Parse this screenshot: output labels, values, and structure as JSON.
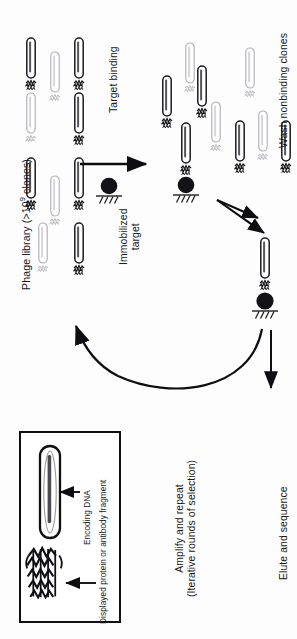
{
  "figure": {
    "orientation": "rotated-90-ccw",
    "background_color": "#fdfdfd",
    "ink_color": "#16161a",
    "faded_ink_color": "#b9b9bd"
  },
  "labels": {
    "phage_library_prefix": "Phage library (>10",
    "phage_library_exponent": "9",
    "phage_library_suffix": " clones)",
    "target_binding": "Target binding",
    "immobilized_line1": "Immobilized",
    "immobilized_line2": "target",
    "wash_nonbinding": "Wash nonbinding clones",
    "elute_and_sequence": "Elute and sequence",
    "amplify_line1": "Amplify and repeat",
    "amplify_line2": "(Iterative rounds of selection)",
    "encoding_dna": "Encoding DNA",
    "displayed_protein": "Displayed protein or antibody fragment"
  },
  "steps": [
    {
      "id": "step-1",
      "name": "phage-library",
      "label": "Phage library (>10⁹ clones)"
    },
    {
      "id": "step-2",
      "name": "target-binding",
      "label": "Target binding"
    },
    {
      "id": "step-3",
      "name": "wash-nonbinding",
      "label": "Wash nonbinding clones"
    },
    {
      "id": "step-4",
      "name": "elute-sequence",
      "label": "Elute and sequence"
    },
    {
      "id": "step-5",
      "name": "amplify-repeat",
      "label": "Amplify and repeat (Iterative rounds of selection)"
    }
  ],
  "library_phages": [
    {
      "x": 31,
      "y": 58,
      "shade": "dark",
      "has_protein": true
    },
    {
      "x": 55,
      "y": 72,
      "shade": "light",
      "has_protein": true
    },
    {
      "x": 79,
      "y": 58,
      "shade": "dark",
      "has_protein": true
    },
    {
      "x": 31,
      "y": 113,
      "shade": "light",
      "has_protein": true
    },
    {
      "x": 79,
      "y": 113,
      "shade": "dark",
      "has_protein": true
    },
    {
      "x": 31,
      "y": 178,
      "shade": "dark",
      "has_protein": true
    },
    {
      "x": 55,
      "y": 196,
      "shade": "light",
      "has_protein": true
    },
    {
      "x": 79,
      "y": 178,
      "shade": "dark",
      "has_protein": true
    },
    {
      "x": 43,
      "y": 243,
      "shade": "light",
      "has_protein": true
    },
    {
      "x": 79,
      "y": 243,
      "shade": "dark",
      "has_protein": true
    }
  ],
  "bound_phages": [
    {
      "x": 167,
      "y": 96,
      "shade": "dark",
      "bound": false
    },
    {
      "x": 190,
      "y": 63,
      "shade": "light",
      "bound": false
    },
    {
      "x": 200,
      "y": 86,
      "shade": "dark",
      "bound": false
    },
    {
      "x": 188,
      "y": 148,
      "shade": "dark",
      "bound": true
    },
    {
      "x": 214,
      "y": 122,
      "shade": "light",
      "bound": false
    }
  ],
  "washed_phages": [
    {
      "x": 250,
      "y": 68,
      "shade": "light"
    },
    {
      "x": 240,
      "y": 138,
      "shade": "light"
    },
    {
      "x": 262,
      "y": 128,
      "shade": "light"
    },
    {
      "x": 285,
      "y": 138,
      "shade": "light"
    }
  ],
  "selected_phage": {
    "x": 265,
    "y": 258,
    "shade": "dark",
    "bound": true
  },
  "immobilized_target": {
    "x": 109,
    "y": 187,
    "radius": 8
  },
  "arrows": [
    {
      "name": "target-binding-arrow",
      "type": "straight",
      "x1": 80,
      "y1": 164,
      "x2": 150,
      "y2": 164
    },
    {
      "name": "wash-arrow-upper",
      "type": "straight",
      "x1": 218,
      "y1": 202,
      "x2": 262,
      "y2": 221
    },
    {
      "name": "wash-arrow-lower",
      "type": "straight",
      "x1": 218,
      "y1": 202,
      "x2": 268,
      "y2": 236
    },
    {
      "name": "elute-arrow",
      "type": "straight",
      "x1": 270,
      "y1": 332,
      "x2": 270,
      "y2": 392
    },
    {
      "name": "amplify-curved-arrow",
      "type": "curved",
      "from_x": 262,
      "from_y": 330,
      "to_x": 74,
      "to_y": 320
    }
  ],
  "inset": {
    "name": "phage-particle-detail",
    "box": {
      "x": 20,
      "y": 432,
      "width": 100,
      "height": 190
    },
    "arrow_to_dna": {
      "x1": 78,
      "y1": 492,
      "x2": 58,
      "y2": 492
    },
    "arrow_to_protein": {
      "x1": 94,
      "y1": 583,
      "x2": 64,
      "y2": 583
    }
  }
}
